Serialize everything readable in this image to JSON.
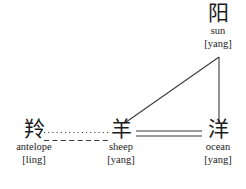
{
  "figure": {
    "type": "diagram",
    "subtype": "semantic-phonetic-network",
    "background_color": "#ffffff",
    "text_color": "#1c1c1c",
    "width": 246,
    "height": 189
  },
  "nodes": [
    {
      "id": "sun",
      "hanzi": "阳",
      "gloss": "sun",
      "pinyin": "[yang]",
      "position": "top-right"
    },
    {
      "id": "antelope",
      "hanzi": "羚",
      "gloss": "antelope",
      "pinyin": "[ling]",
      "position": "bottom-left"
    },
    {
      "id": "sheep",
      "hanzi": "羊",
      "gloss": "sheep",
      "pinyin": "[yang]",
      "position": "bottom-center"
    },
    {
      "id": "ocean",
      "hanzi": "洋",
      "gloss": "ocean",
      "pinyin": "[yang]",
      "position": "bottom-right"
    }
  ],
  "edges": [
    {
      "id": "antelope-sheep-dotted",
      "from": "antelope",
      "to": "sheep",
      "style": "dotted",
      "color": "#3a3a3a"
    },
    {
      "id": "antelope-sheep-dashed",
      "from": "antelope",
      "to": "sheep",
      "style": "dashed",
      "color": "#3a3a3a"
    },
    {
      "id": "sheep-ocean-double",
      "from": "sheep",
      "to": "ocean",
      "style": "double-solid",
      "color": "#3a3a3a"
    },
    {
      "id": "sheep-sun-diagonal",
      "from": "sheep",
      "to": "sun",
      "style": "solid",
      "color": "#3a3a3a"
    },
    {
      "id": "sun-ocean-vertical",
      "from": "sun",
      "to": "ocean",
      "style": "solid",
      "color": "#3a3a3a"
    }
  ]
}
